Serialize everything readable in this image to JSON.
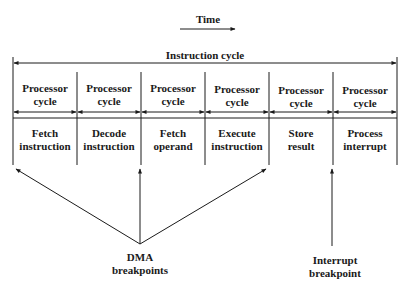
{
  "time_label": "Time",
  "instruction_cycle_label": "Instruction cycle",
  "stages": [
    {
      "cycle_line1": "Processor",
      "cycle_line2": "cycle",
      "step_line1": "Fetch",
      "step_line2": "instruction"
    },
    {
      "cycle_line1": "Processor",
      "cycle_line2": "cycle",
      "step_line1": "Decode",
      "step_line2": "instruction"
    },
    {
      "cycle_line1": "Processor",
      "cycle_line2": "cycle",
      "step_line1": "Fetch",
      "step_line2": "operand"
    },
    {
      "cycle_line1": "Processor",
      "cycle_line2": "cycle",
      "step_line1": "Execute",
      "step_line2": "instruction"
    },
    {
      "cycle_line1": "Processor",
      "cycle_line2": "cycle",
      "step_line1": "Store",
      "step_line2": "result"
    },
    {
      "cycle_line1": "Processor",
      "cycle_line2": "cycle",
      "step_line1": "Process",
      "step_line2": "interrupt"
    }
  ],
  "dma_label": {
    "line1": "DMA",
    "line2": "breakpoints"
  },
  "interrupt_label": {
    "line1": "Interrupt",
    "line2": "breakpoint"
  }
}
